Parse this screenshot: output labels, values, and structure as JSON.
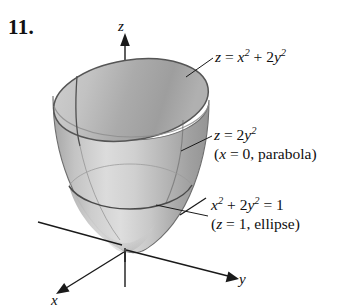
{
  "figure": {
    "problem_number": "11.",
    "background_color": "#ffffff",
    "ink_color": "#101010"
  },
  "axes": {
    "z_label": "z",
    "y_label": "y",
    "x_label": "x"
  },
  "annotations": {
    "surface": {
      "equation_lhs": "z",
      "equation_eq": " = ",
      "term1_base": "x",
      "term1_exp": "2",
      "plus": " + ",
      "term2_coef": "2",
      "term2_base": "y",
      "term2_exp": "2"
    },
    "parabola": {
      "line1_lhs": "z",
      "line1_eq": " = ",
      "line1_coef": "2",
      "line1_base": "y",
      "line1_exp": "2",
      "line2_open": "(",
      "line2_var": "x",
      "line2_eq": " = 0, ",
      "line2_word": "parabola",
      "line2_close": ")"
    },
    "ellipse": {
      "line1_base1": "x",
      "line1_exp1": "2",
      "line1_plus": " + ",
      "line1_coef2": "2",
      "line1_base2": "y",
      "line1_exp2": "2",
      "line1_eq": " = 1",
      "line2_open": "(",
      "line2_var": "z",
      "line2_eq": " = 1, ",
      "line2_word": "ellipse",
      "line2_close": ")"
    }
  },
  "surface_colors": {
    "rim_outline": "#5a5a5a",
    "inner_dark": "#a8a8a8",
    "inner_light": "#c9c9c9",
    "outer_wall_light": "#d2d2d2",
    "outer_wall_mid": "#b4b4b4",
    "outer_wall_dark": "#9a9a9a",
    "trace_line": "#4a4a4a"
  }
}
